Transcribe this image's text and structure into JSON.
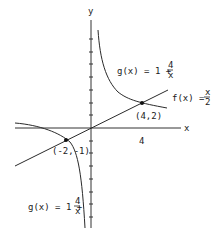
{
  "diagram": {
    "axes": {
      "x_label": "x",
      "y_label": "y",
      "x_tick_label": "4"
    },
    "functions": {
      "g_upper": {
        "name": "g(x) = 1 + ",
        "num": "4",
        "den": "x"
      },
      "f": {
        "name": "f(x) = ",
        "num": "x",
        "den": "2"
      },
      "g_lower": {
        "name": "g(x) = 1 + ",
        "num": "4",
        "den": "x"
      }
    },
    "points": [
      {
        "label": "(4,2)",
        "x": 4,
        "y": 2
      },
      {
        "label": "(-2,-1)",
        "x": -2,
        "y": -1
      }
    ],
    "colors": {
      "ink": "#2a2a2a",
      "background": "#ffffff"
    }
  }
}
